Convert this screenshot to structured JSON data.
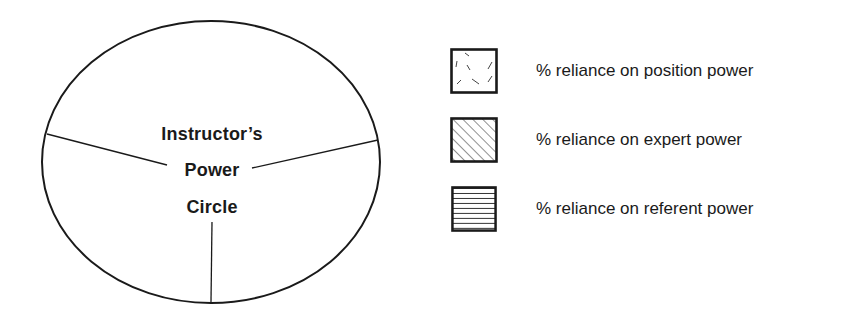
{
  "diagram": {
    "title_lines": [
      "Instructor’s",
      "Power",
      "Circle"
    ],
    "shape": "circle divided into three sections",
    "divider_count": 3
  },
  "legend": {
    "items": [
      {
        "label": "% reliance on position power",
        "pattern": "scattered-dashes"
      },
      {
        "label": "% reliance on expert power",
        "pattern": "diagonal-hatch"
      },
      {
        "label": "% reliance on referent power",
        "pattern": "horizontal-lines"
      }
    ]
  },
  "colors": {
    "stroke": "#1a1a1a",
    "background": "#ffffff"
  }
}
